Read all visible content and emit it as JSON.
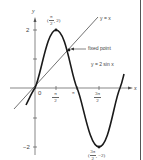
{
  "diagram": {
    "axes": {
      "x_label": "x",
      "y_label": "y",
      "origin_label": "0",
      "y_ticks": [
        {
          "value": 2,
          "label": "2"
        },
        {
          "value": 1,
          "label": ""
        },
        {
          "value": -1,
          "label": ""
        },
        {
          "value": -2,
          "label": "−2"
        }
      ],
      "x_ticks": [
        {
          "value": "π/2",
          "num": "π",
          "den": "2"
        },
        {
          "value": "π",
          "label": "π"
        },
        {
          "value": "3π/2",
          "num": "3π",
          "den": "2"
        }
      ]
    },
    "curves": [
      {
        "name": "sine",
        "label": "y = 2 sin x"
      },
      {
        "name": "identity",
        "label": "y = x"
      }
    ],
    "annotations": {
      "max_point": {
        "open": "(",
        "num": "π",
        "den": "2",
        "rest": ", 2)"
      },
      "min_point": {
        "open": "(",
        "num": "3π",
        "den": "2",
        "rest": ", −2)"
      },
      "fixed_point": "fixed point"
    },
    "colors": {
      "curve": "#1a1a1a",
      "axis": "#555555",
      "line": "#333333",
      "text": "#444444"
    }
  }
}
